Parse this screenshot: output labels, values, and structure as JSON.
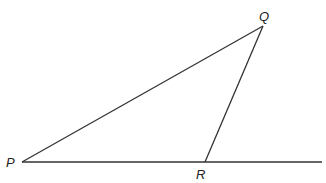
{
  "diagram": {
    "type": "geometry-triangle",
    "points": {
      "P": {
        "label": "P",
        "x": 22,
        "y": 162
      },
      "Q": {
        "label": "Q",
        "x": 263,
        "y": 26
      },
      "R": {
        "label": "R",
        "x": 205,
        "y": 162
      }
    },
    "segments": [
      {
        "from": "P",
        "to": "Q"
      },
      {
        "from": "Q",
        "to": "R"
      },
      {
        "from": "P",
        "to": "R",
        "extended_to_x": 322
      }
    ],
    "line_color": "#333333",
    "label_color": "#222222"
  }
}
